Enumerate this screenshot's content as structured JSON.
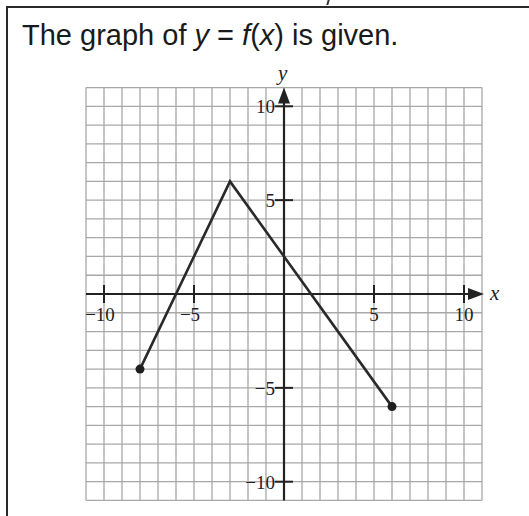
{
  "prompt": {
    "prefix": "The graph of ",
    "math_y": "y",
    "equals": " = ",
    "math_f": "f",
    "paren_open": "(",
    "math_x": "x",
    "paren_close": ")",
    "suffix": " is given."
  },
  "colors": {
    "grid": "#a8a8a8",
    "axis": "#222222",
    "line": "#2a2a2a",
    "point": "#1e1e1e",
    "frame": "#2a2a2a"
  },
  "chart_data": {
    "type": "line",
    "title": "The graph of y = f(x) is given.",
    "xlabel": "x",
    "ylabel": "y",
    "xlim": [
      -11,
      11
    ],
    "ylim": [
      -11,
      11
    ],
    "grid": true,
    "grid_step": 1,
    "x_ticks": [
      -10,
      -5,
      5,
      10
    ],
    "x_tick_labels": [
      "−10",
      "−5",
      "5",
      "10"
    ],
    "y_ticks": [
      10,
      5,
      -5,
      -10
    ],
    "y_tick_labels": [
      "10",
      "5",
      "−5",
      "−10"
    ],
    "series": [
      {
        "name": "f(x)",
        "points": [
          [
            -8,
            -4
          ],
          [
            -3,
            6
          ],
          [
            6,
            -6
          ]
        ],
        "endpoints_closed": [
          [
            -8,
            -4
          ],
          [
            6,
            -6
          ]
        ]
      }
    ],
    "legend": null
  }
}
